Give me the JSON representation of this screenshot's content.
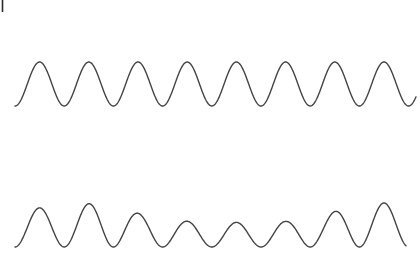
{
  "figure": {
    "title": "",
    "background_color": "#ffffff",
    "line_color": "#434343",
    "line_width": 1.4,
    "width": 420,
    "height": 272,
    "corner_mark": {
      "name": "crop-tick-mark",
      "x": 2.5,
      "y_top": 0,
      "y_bottom": 12,
      "color": "#2b2b2b",
      "width": 1.6
    }
  },
  "chart_data": {
    "type": "line",
    "title": "",
    "subtitle": "",
    "xlabel": "",
    "ylabel": "",
    "grid": false,
    "legend": "none",
    "axis_visible": false,
    "xlim": [
      0,
      420
    ],
    "ylim_top_panel": [
      0,
      136
    ],
    "ylim_bottom_panel": [
      136,
      272
    ],
    "series": [
      {
        "name": "carrier-wave",
        "panel": "top",
        "samples": 8,
        "period_px": 49.2,
        "phase_start_x": 15,
        "baseline_y": 106,
        "peak_y": 18,
        "amplitude_px": 44,
        "x_start": 15,
        "x_end": 416,
        "peak_x_positions": [
          41,
          90,
          139,
          188,
          237,
          287,
          336,
          385
        ],
        "trough_x_positions": [
          65,
          115,
          164,
          213,
          262,
          311,
          360
        ],
        "peak_amplitudes": [
          1.0,
          1.0,
          1.0,
          1.0,
          1.0,
          1.0,
          1.0,
          1.0
        ]
      },
      {
        "name": "amplitude-modulated-wave",
        "panel": "bottom",
        "samples": 8,
        "period_px": 49.2,
        "phase_start_x": 15,
        "baseline_y": 247,
        "amplitude_px": 44,
        "x_start": 15,
        "x_end": 406,
        "peak_x_positions": [
          51,
          101,
          147,
          192,
          237,
          283,
          320,
          365
        ],
        "peak_y_positions": [
          168,
          160,
          182,
          196,
          198,
          196,
          182,
          160
        ],
        "trough_y_positions": [
          250,
          250,
          240,
          238,
          238,
          240,
          250,
          250
        ],
        "peak_amplitudes": [
          0.89,
          1.0,
          0.74,
          0.58,
          0.56,
          0.58,
          0.74,
          1.0
        ],
        "modulation": "envelope dips at center, maxima near both ends"
      }
    ]
  }
}
